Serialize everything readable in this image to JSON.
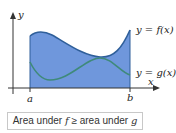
{
  "diagram": {
    "axis_labels": {
      "y": "y",
      "x": "x"
    },
    "bounds": {
      "a": "a",
      "b": "b"
    },
    "curves": [
      {
        "name": "f",
        "label": "y = f(x)",
        "color": "#3a6ea5"
      },
      {
        "name": "g",
        "label": "y = g(x)",
        "color": "#3f8a7a"
      }
    ],
    "fill_color": "#6f97dc",
    "caption": {
      "prefix": "Area under ",
      "f": "f",
      "mid": " ≥ area under ",
      "g": "g"
    }
  }
}
